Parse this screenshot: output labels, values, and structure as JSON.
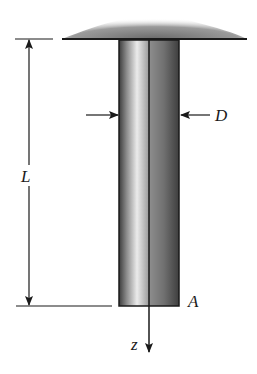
{
  "figure": {
    "labels": {
      "length": "L",
      "diameter": "D",
      "end_point": "A",
      "axis": "z"
    },
    "colors": {
      "line": "#1a1a1a",
      "bar_dark": "#3a3a3a",
      "bar_light": "#e8e8e8",
      "support_shade": "#7a7a7a",
      "background": "#ffffff"
    }
  }
}
